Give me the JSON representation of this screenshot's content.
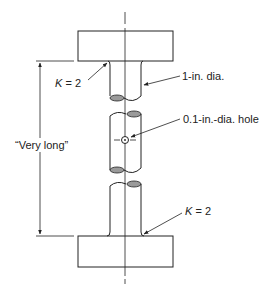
{
  "diagram": {
    "type": "mechanical-drawing",
    "colors": {
      "line": "#222222",
      "fill_ellipse": "#9a9a9a",
      "background": "#ffffff"
    },
    "labels": {
      "top_fillet": {
        "k_symbol": "K",
        "k_value": "= 2"
      },
      "bottom_fillet": {
        "k_symbol": "K",
        "k_value": "= 2"
      },
      "shaft_diameter": "1-in. dia.",
      "hole": "0.1-in.-dia. hole",
      "length": "“Very long”"
    },
    "components": [
      {
        "id": "top-block",
        "label": ""
      },
      {
        "id": "top-shaft-segment",
        "label": "1-in. dia."
      },
      {
        "id": "middle-shaft-segment",
        "label": "0.1-in.-dia. hole"
      },
      {
        "id": "bottom-shaft-segment",
        "label": ""
      },
      {
        "id": "bottom-block",
        "label": ""
      }
    ]
  }
}
